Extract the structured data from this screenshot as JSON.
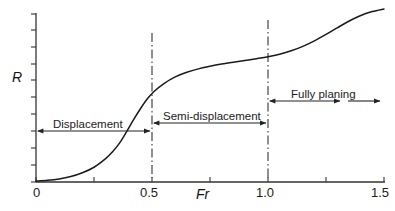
{
  "chart_data": {
    "type": "line",
    "title": "",
    "subtitle": "",
    "xlabel": "Fr",
    "ylabel": "R",
    "xlim": [
      0,
      1.5
    ],
    "ylim": [
      0,
      1
    ],
    "grid": false,
    "legend": null,
    "x_ticks": [
      {
        "value": 0,
        "label": "0"
      },
      {
        "value": 0.25,
        "label": ""
      },
      {
        "value": 0.5,
        "label": "0.5"
      },
      {
        "value": 0.75,
        "label": ""
      },
      {
        "value": 1.0,
        "label": "1.0"
      },
      {
        "value": 1.25,
        "label": ""
      },
      {
        "value": 1.5,
        "label": "1.5"
      }
    ],
    "y_ticks": [
      {
        "value": 0.0,
        "label": ""
      },
      {
        "value": 0.1,
        "label": ""
      },
      {
        "value": 0.2,
        "label": ""
      },
      {
        "value": 0.3,
        "label": ""
      },
      {
        "value": 0.4,
        "label": ""
      },
      {
        "value": 0.5,
        "label": ""
      },
      {
        "value": 0.6,
        "label": ""
      },
      {
        "value": 0.7,
        "label": ""
      },
      {
        "value": 0.8,
        "label": ""
      },
      {
        "value": 0.9,
        "label": ""
      },
      {
        "value": 1.0,
        "label": ""
      }
    ],
    "series": [
      {
        "name": "Resistance curve",
        "color": "#1a1a1a",
        "x": [
          0.0,
          0.05,
          0.1,
          0.15,
          0.2,
          0.25,
          0.3,
          0.33,
          0.36,
          0.39,
          0.42,
          0.45,
          0.48,
          0.51,
          0.55,
          0.6,
          0.65,
          0.7,
          0.75,
          0.8,
          0.85,
          0.9,
          0.95,
          1.0,
          1.05,
          1.1,
          1.15,
          1.2,
          1.25,
          1.3,
          1.35,
          1.4,
          1.45,
          1.5
        ],
        "y": [
          0.0,
          0.004,
          0.012,
          0.026,
          0.048,
          0.08,
          0.13,
          0.17,
          0.22,
          0.285,
          0.355,
          0.42,
          0.478,
          0.522,
          0.565,
          0.605,
          0.632,
          0.652,
          0.667,
          0.68,
          0.691,
          0.701,
          0.711,
          0.722,
          0.737,
          0.757,
          0.783,
          0.815,
          0.852,
          0.892,
          0.93,
          0.962,
          0.985,
          1.0
        ]
      }
    ],
    "reference_lines": [
      {
        "name": "boundary-displacement-semi",
        "x": 0.5,
        "style": "dash-dot",
        "color": "#222222"
      },
      {
        "name": "boundary-semi-planing",
        "x": 1.0,
        "style": "dash-dot",
        "color": "#222222"
      }
    ],
    "annotations": [
      {
        "name": "displacement",
        "label": "Displacement",
        "x_start": 0.0,
        "x_end": 0.5,
        "arrow": "double",
        "label_position": "above"
      },
      {
        "name": "semi-displacement",
        "label": "Semi-displacement",
        "x_start": 0.5,
        "x_end": 1.0,
        "arrow": "double",
        "label_position": "above"
      },
      {
        "name": "fully-planing",
        "label": "Fully planing",
        "x_start": 1.0,
        "x_end": 1.5,
        "arrow": "double-open-right",
        "label_position": "above"
      }
    ]
  },
  "axes": {
    "y_axis_title": "R",
    "x_axis_title": "Fr",
    "origin_label": "0"
  },
  "labels": {
    "tick_0": "0",
    "tick_05": "0.5",
    "tick_10": "1.0",
    "tick_15": "1.5",
    "region_displacement": "Displacement",
    "region_semi_displacement": "Semi-displacement",
    "region_fully_planing": "Fully planing"
  },
  "colors": {
    "curve": "#1a1a1a",
    "axis": "#333333",
    "annotation": "#222222",
    "dashed": "#333333",
    "text": "#1a1a1a",
    "background": "#ffffff"
  }
}
